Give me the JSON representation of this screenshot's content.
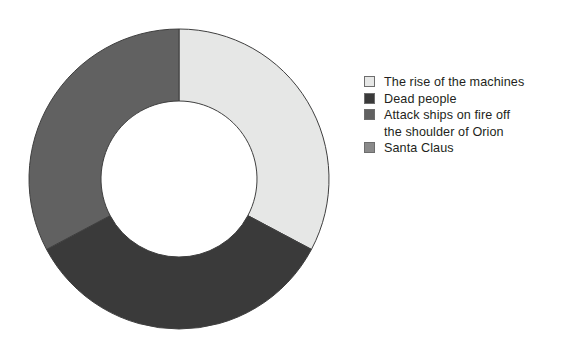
{
  "chart_data": {
    "type": "pie",
    "variant": "donut",
    "title": "",
    "subtitle": "",
    "xlabel": "",
    "ylabel": "",
    "grid": false,
    "legend_position": "right",
    "hole_ratio": 0.52,
    "start_angle_deg": 0,
    "direction": "clockwise",
    "categories": [
      "The rise of the machines",
      "Dead people",
      "Attack ships on fire off\nthe shoulder of Orion",
      "Santa Claus"
    ],
    "values": [
      33,
      34,
      33,
      0
    ],
    "percent_labels": [
      "33%",
      "34%",
      "33%",
      "0%"
    ],
    "colors": [
      "#e6e7e6",
      "#3a3a3a",
      "#616161",
      "#8a8a8a"
    ],
    "slice_border_color": "#3f3f3f",
    "slice_border_width": 1,
    "background": "#ffffff",
    "slices": [
      {
        "label": "The rise of the machines",
        "value": 33,
        "color": "#e6e7e6",
        "start_angle_deg": 0,
        "end_angle_deg": 118
      },
      {
        "label": "Dead people",
        "value": 34,
        "color": "#3a3a3a",
        "start_angle_deg": 118,
        "end_angle_deg": 242
      },
      {
        "label": "Attack ships on fire off the shoulder of Orion",
        "value": 33,
        "color": "#616161",
        "start_angle_deg": 242,
        "end_angle_deg": 360
      },
      {
        "label": "Santa Claus",
        "value": 0,
        "color": "#8a8a8a",
        "start_angle_deg": 360,
        "end_angle_deg": 360
      }
    ]
  },
  "legend": {
    "items": [
      {
        "label": "The rise of the machines",
        "color": "#e6e7e6"
      },
      {
        "label": "Dead people",
        "color": "#3a3a3a"
      },
      {
        "label": "Attack ships on fire off\nthe shoulder of Orion",
        "color": "#616161"
      },
      {
        "label": "Santa Claus",
        "color": "#8a8a8a"
      }
    ]
  }
}
